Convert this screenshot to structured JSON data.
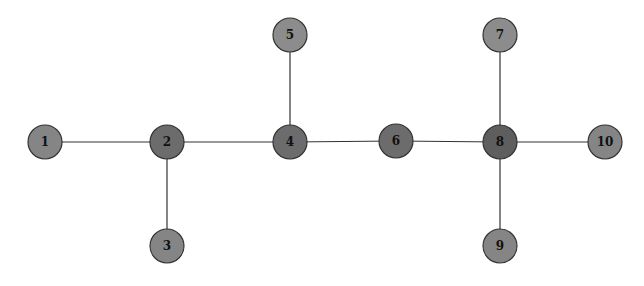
{
  "graph": {
    "nodes": [
      {
        "id": "1",
        "x": 45,
        "y": 142,
        "fill": "#858585"
      },
      {
        "id": "2",
        "x": 167,
        "y": 142,
        "fill": "#6c6c6c"
      },
      {
        "id": "3",
        "x": 167,
        "y": 246,
        "fill": "#858585"
      },
      {
        "id": "4",
        "x": 290,
        "y": 142,
        "fill": "#6c6c6c"
      },
      {
        "id": "5",
        "x": 290,
        "y": 35,
        "fill": "#8c8c8c"
      },
      {
        "id": "6",
        "x": 396,
        "y": 141,
        "fill": "#6c6c6c"
      },
      {
        "id": "7",
        "x": 500,
        "y": 35,
        "fill": "#8c8c8c"
      },
      {
        "id": "8",
        "x": 500,
        "y": 142,
        "fill": "#5e5e5e"
      },
      {
        "id": "9",
        "x": 500,
        "y": 246,
        "fill": "#858585"
      },
      {
        "id": "10",
        "x": 605,
        "y": 142,
        "fill": "#858585"
      }
    ],
    "edges": [
      [
        "1",
        "2"
      ],
      [
        "2",
        "3"
      ],
      [
        "2",
        "4"
      ],
      [
        "4",
        "5"
      ],
      [
        "4",
        "6"
      ],
      [
        "6",
        "8"
      ],
      [
        "8",
        "7"
      ],
      [
        "8",
        "9"
      ],
      [
        "8",
        "10"
      ]
    ],
    "node_radius": 17,
    "edge_color": "#333333",
    "stroke_color": "#333333"
  }
}
